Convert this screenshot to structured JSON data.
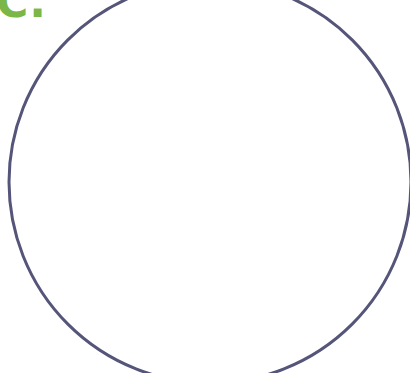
{
  "figure": {
    "label": "C.",
    "label_color": "#7ab648",
    "circle": {
      "stroke_color": "#55557a",
      "fill_color": "#ffffff",
      "cx": 210,
      "cy": 182,
      "r": 201,
      "stroke_width": 3
    }
  }
}
